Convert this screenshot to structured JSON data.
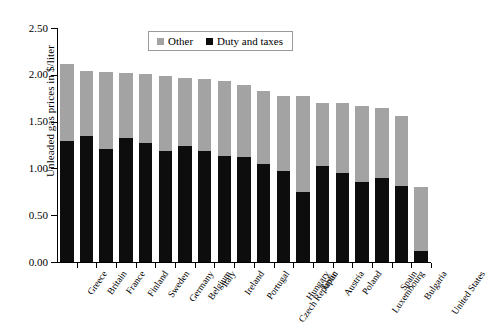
{
  "chart_data": {
    "type": "bar",
    "stacked": true,
    "title": "",
    "xlabel": "",
    "ylabel": "Unleaded gas prices in $/liter",
    "ylim": [
      0.0,
      2.5
    ],
    "ytick_labels": [
      "0.00",
      "0.50",
      "1.00",
      "1.50",
      "2.00",
      "2.50"
    ],
    "ytick_values": [
      0.0,
      0.5,
      1.0,
      1.5,
      2.0,
      2.5
    ],
    "grid": false,
    "legend_position": "top-center",
    "categories": [
      "Greece",
      "Britain",
      "France",
      "Finland",
      "Sweden",
      "Germany",
      "Belgium",
      "Italy",
      "Ireland",
      "Portugal",
      "Czech Republic",
      "Hungary",
      "Japan",
      "Austria",
      "Poland",
      "Luxembourg",
      "Spain",
      "Bulgaria",
      "United States"
    ],
    "series": [
      {
        "name": "Duty and taxes",
        "color": "#0d0d0d",
        "values": [
          1.29,
          1.35,
          1.21,
          1.33,
          1.27,
          1.19,
          1.24,
          1.19,
          1.13,
          1.12,
          1.05,
          0.97,
          0.75,
          1.03,
          0.95,
          0.85,
          0.9,
          0.81,
          0.12
        ]
      },
      {
        "name": "Other",
        "color": "#a3a3a3",
        "values": [
          0.83,
          0.69,
          0.82,
          0.69,
          0.74,
          0.8,
          0.73,
          0.76,
          0.8,
          0.77,
          0.78,
          0.8,
          1.02,
          0.67,
          0.75,
          0.82,
          0.75,
          0.75,
          0.68
        ]
      }
    ],
    "totals": [
      2.12,
      2.04,
      2.03,
      2.02,
      2.01,
      1.99,
      1.97,
      1.95,
      1.93,
      1.89,
      1.83,
      1.77,
      1.77,
      1.7,
      1.7,
      1.67,
      1.65,
      1.56,
      0.8
    ]
  },
  "legend": {
    "items": [
      {
        "label": "Other",
        "color": "#a3a3a3"
      },
      {
        "label": "Duty and taxes",
        "color": "#0d0d0d"
      }
    ]
  }
}
